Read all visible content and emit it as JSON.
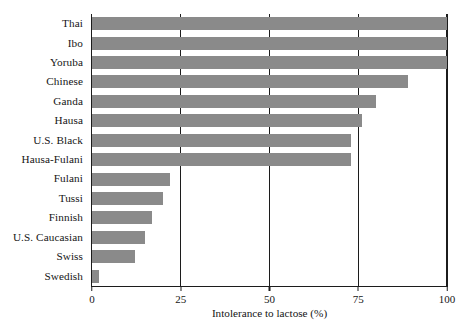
{
  "chart_data": {
    "type": "bar",
    "orientation": "horizontal",
    "title": "",
    "xlabel": "Intolerance to lactose (%)",
    "ylabel": "",
    "xlim": [
      0,
      100
    ],
    "xticks": [
      0,
      25,
      50,
      75,
      100
    ],
    "xticklabels": [
      "0",
      "25",
      "50",
      "75",
      "100"
    ],
    "grid": "vertical",
    "legend": "none",
    "bar_color": "#8a8a8a",
    "axis_color": "#1c1c1c",
    "categories": [
      "Thai",
      "Ibo",
      "Yoruba",
      "Chinese",
      "Ganda",
      "Hausa",
      "U.S. Black",
      "Hausa-Fulani",
      "Fulani",
      "Tussi",
      "Finnish",
      "U.S. Caucasian",
      "Swiss",
      "Swedish"
    ],
    "values": [
      100,
      100,
      100,
      89,
      80,
      76,
      73,
      73,
      22,
      20,
      17,
      15,
      12,
      2
    ]
  }
}
